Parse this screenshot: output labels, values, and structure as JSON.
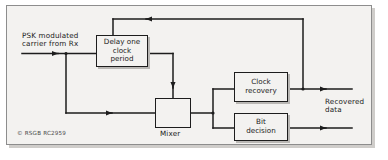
{
  "figure": {
    "background": "#f3f2f0",
    "line_color": "#1d1d1d",
    "credit": "© RSGB RC2959"
  },
  "labels": {
    "input_line1": "PSK modulated",
    "input_line2": "carrier from Rx",
    "mixer": "Mixer",
    "output_line1": "Recovered",
    "output_line2": "data"
  },
  "blocks": [
    {
      "id": "delay",
      "line1": "Delay one",
      "line2": "clock",
      "line3": "period"
    },
    {
      "id": "clock-recovery",
      "line1": "Clock",
      "line2": "recovery",
      "line3": ""
    },
    {
      "id": "bit-decision",
      "line1": "Bit",
      "line2": "decision",
      "line3": ""
    }
  ],
  "mixer": {
    "symbol": "cross-multiplier"
  }
}
